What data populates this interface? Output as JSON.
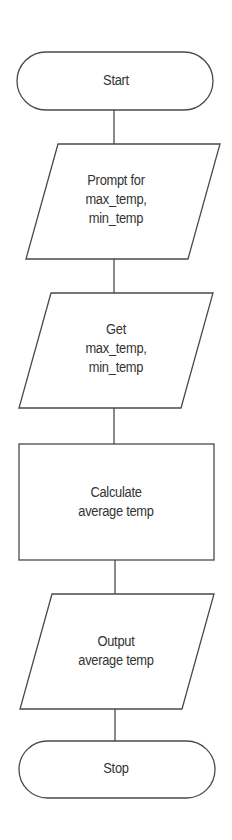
{
  "diagram": {
    "type": "flowchart",
    "colors": {
      "stroke": "#4a4a4a",
      "text": "#333333",
      "fill": "#ffffff",
      "background": "#ffffff"
    },
    "nodes": [
      {
        "id": "start",
        "shape": "terminal",
        "lines": [
          "Start"
        ]
      },
      {
        "id": "prompt",
        "shape": "parallelogram",
        "lines": [
          "Prompt for",
          "max_temp,",
          "min_temp"
        ]
      },
      {
        "id": "get",
        "shape": "parallelogram",
        "lines": [
          "Get",
          "max_temp,",
          "min_temp"
        ]
      },
      {
        "id": "calculate",
        "shape": "rectangle",
        "lines": [
          "Calculate",
          "average temp"
        ]
      },
      {
        "id": "output",
        "shape": "parallelogram",
        "lines": [
          "Output",
          "average temp"
        ]
      },
      {
        "id": "stop",
        "shape": "terminal",
        "lines": [
          "Stop"
        ]
      }
    ],
    "edges": [
      {
        "from": "start",
        "to": "prompt"
      },
      {
        "from": "prompt",
        "to": "get"
      },
      {
        "from": "get",
        "to": "calculate"
      },
      {
        "from": "calculate",
        "to": "output"
      },
      {
        "from": "output",
        "to": "stop"
      }
    ]
  }
}
